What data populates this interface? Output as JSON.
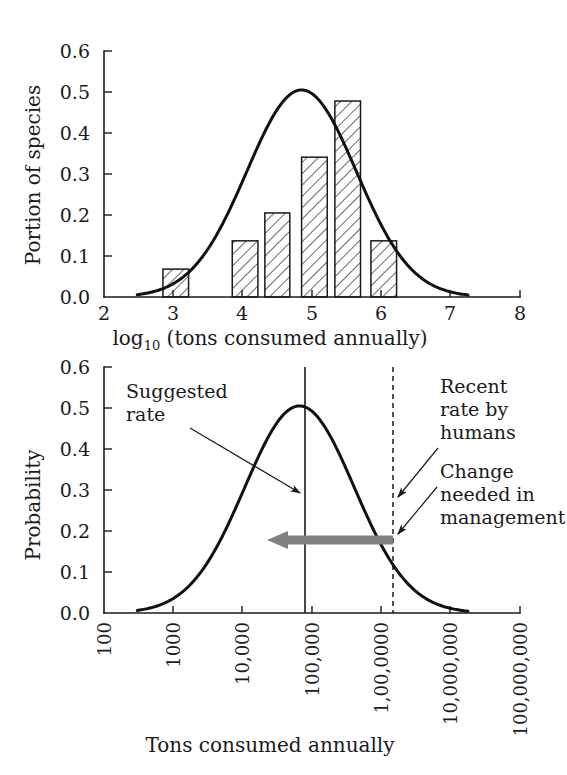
{
  "figure": {
    "background": "#ffffff",
    "ink_color": "#1a1a1a",
    "accent_gray": "#808080"
  },
  "chart_data": [
    {
      "id": "top-panel",
      "type": "bar",
      "title": "",
      "xlabel": "log10 (tons consumed annually)",
      "xlabel_base": "log",
      "xlabel_sub": "10",
      "xlabel_rest": " (tons consumed annually)",
      "ylabel": "Portion of species",
      "xlim": [
        2,
        8
      ],
      "ylim": [
        0,
        0.6
      ],
      "grid": false,
      "legend": "none",
      "xticks": [
        2,
        3,
        4,
        5,
        6,
        7,
        8
      ],
      "xticklabels": [
        "2",
        "3",
        "4",
        "5",
        "6",
        "7",
        "8"
      ],
      "yticks": [
        0.0,
        0.1,
        0.2,
        0.3,
        0.4,
        0.5,
        0.6
      ],
      "yticklabels": [
        "0.0",
        "0.1",
        "0.2",
        "0.3",
        "0.4",
        "0.5",
        "0.6"
      ],
      "bar_style": "hatched-diagonal",
      "bars": [
        {
          "x0": 2.85,
          "x1": 3.22,
          "value": 0.068
        },
        {
          "x0": 3.85,
          "x1": 4.22,
          "value": 0.137
        },
        {
          "x0": 4.32,
          "x1": 4.68,
          "value": 0.205
        },
        {
          "x0": 4.85,
          "x1": 5.22,
          "value": 0.341
        },
        {
          "x0": 5.33,
          "x1": 5.7,
          "value": 0.478
        },
        {
          "x0": 5.85,
          "x1": 6.22,
          "value": 0.137
        }
      ],
      "overlay_curve": {
        "name": "normal-fit",
        "kind": "gaussian",
        "mean": 4.85,
        "sigma": 0.79,
        "peak": 0.505,
        "x_start": 2.48,
        "x_end": 7.25
      }
    },
    {
      "id": "bottom-panel",
      "type": "line",
      "title": "",
      "xlabel": "Tons consumed annually",
      "ylabel": "Probability",
      "xlim_log10": [
        2,
        8
      ],
      "ylim": [
        0,
        0.6
      ],
      "grid": false,
      "legend": "none",
      "xticks": [
        2,
        3,
        4,
        5,
        6,
        7,
        8
      ],
      "xticklabels": [
        "100",
        "1000",
        "10,000",
        "100,000",
        "1,00,0000",
        "10,000,000",
        "100,000,000"
      ],
      "xticklabel_rotation": -90,
      "yticks": [
        0.0,
        0.1,
        0.2,
        0.3,
        0.4,
        0.5,
        0.6
      ],
      "yticklabels": [
        "0.0",
        "0.1",
        "0.2",
        "0.3",
        "0.4",
        "0.5",
        "0.6"
      ],
      "curve": {
        "name": "probability-distribution",
        "kind": "gaussian",
        "mean": 4.82,
        "sigma": 0.79,
        "peak": 0.505,
        "x_start": 2.48,
        "x_end": 7.25
      },
      "markers": [
        {
          "name": "suggested-rate",
          "style": "solid-vertical-line",
          "x_log10": 4.9,
          "label": "Suggested\nrate",
          "label_line1": "Suggested",
          "label_line2": "rate"
        },
        {
          "name": "recent-rate-by-humans",
          "style": "dashed-vertical-line",
          "x_log10": 6.17,
          "label_line1": "Recent",
          "label_line2": "rate by",
          "label_line3": "humans"
        }
      ],
      "annotations": [
        {
          "name": "change-needed-in-management",
          "label_line1": "Change",
          "label_line2": "needed in",
          "label_line3": "management",
          "arrow": {
            "style": "thick-gray-left-arrow",
            "color": "#808080",
            "from_x_log10": 6.17,
            "to_x_log10": 4.95,
            "y_value": 0.186
          }
        }
      ]
    }
  ]
}
